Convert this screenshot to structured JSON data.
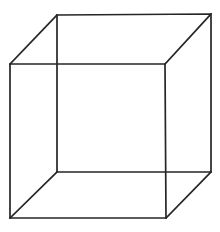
{
  "figure": {
    "title": "Necker cube",
    "type": "line-drawing",
    "projection": "oblique parallel projection",
    "stroke_color": "#262626",
    "background_color": "#ffffff",
    "stroke_width_px": 1.7,
    "canvas": {
      "width": 220,
      "height": 232
    }
  },
  "geometry": {
    "vertices": {
      "front_top_left": {
        "name": "front-top-left",
        "x": 10,
        "y": 64
      },
      "front_top_right": {
        "name": "front-top-right",
        "x": 165,
        "y": 64
      },
      "front_bottom_right": {
        "name": "front-bottom-right",
        "x": 166,
        "y": 218
      },
      "front_bottom_left": {
        "name": "front-bottom-left",
        "x": 10,
        "y": 218
      },
      "back_top_left": {
        "name": "back-top-left",
        "x": 57,
        "y": 15
      },
      "back_top_right": {
        "name": "back-top-right",
        "x": 211,
        "y": 14
      },
      "back_bottom_right": {
        "name": "back-bottom-right",
        "x": 211,
        "y": 172
      },
      "back_bottom_left": {
        "name": "back-bottom-left",
        "x": 57,
        "y": 172
      }
    },
    "front_face_path": "M 10,64 L 165,64 L 166,218 L 10,218 Z",
    "back_face_path": "M 57,15 L 211,14 L 211,172 L 57,172 Z",
    "connector_top_left_path": "M 10,64 L 57,15",
    "connector_top_right_path": "M 165,64 L 211,14",
    "connector_bottom_right_path": "M 166,218 L 211,172",
    "connector_bottom_left_path": "M 10,218 L 57,172",
    "edge_count": 12,
    "vertex_count": 8,
    "face_count": 6
  }
}
